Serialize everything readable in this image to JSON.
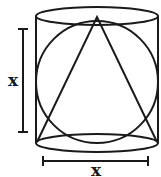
{
  "diagram": {
    "shapes": {
      "cylinder": {
        "top_ellipse": {
          "cx": 97,
          "cy": 16,
          "rx": 61,
          "ry": 9
        },
        "bottom_ellipse": {
          "cx": 97,
          "cy": 143,
          "rx": 61,
          "ry": 9
        },
        "left_x": 36,
        "right_x": 158
      },
      "sphere": {
        "cx": 97,
        "cy": 82,
        "r": 61
      },
      "cone": {
        "apex": [
          97,
          17
        ],
        "base_left": [
          37,
          142
        ],
        "base_right": [
          157,
          142
        ]
      }
    },
    "dimensions": {
      "height": {
        "label": "x"
      },
      "diameter": {
        "label": "x"
      }
    },
    "colors": {
      "stroke": "#1a1a1a",
      "background": "#ffffff"
    }
  }
}
